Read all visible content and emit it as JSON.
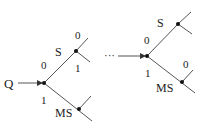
{
  "diagram": {
    "left_tree": {
      "root_label": "Q",
      "upper_edge_label": "0",
      "lower_edge_label": "1",
      "upper_node_label": "S",
      "upper_node_out0": "0",
      "upper_node_out1": "1",
      "lower_node_label": "MS"
    },
    "continuation": "···",
    "right_tree": {
      "upper_edge_label": "0",
      "lower_edge_label": "1",
      "upper_node_label": "S",
      "lower_node_label": "MS",
      "lower_node_out0": "0"
    },
    "colors": {
      "line": "#555555",
      "node": "#111111",
      "text": "#222222"
    }
  }
}
